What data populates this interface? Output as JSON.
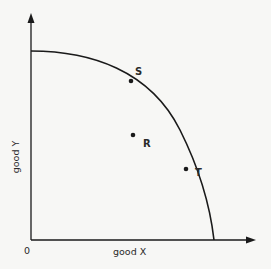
{
  "diagram": {
    "type": "production-possibility-frontier",
    "x_axis": {
      "label": "good X",
      "origin_label": "0"
    },
    "y_axis": {
      "label": "good Y"
    },
    "points": [
      {
        "id": "S",
        "label": "S",
        "position": "on-curve"
      },
      {
        "id": "T",
        "label": "T",
        "position": "on-curve"
      },
      {
        "id": "R",
        "label": "R",
        "position": "inside-curve"
      }
    ],
    "colors": {
      "line": "#1a1a1a",
      "background": "#f7f7f5",
      "text": "#2a2a2a"
    }
  }
}
